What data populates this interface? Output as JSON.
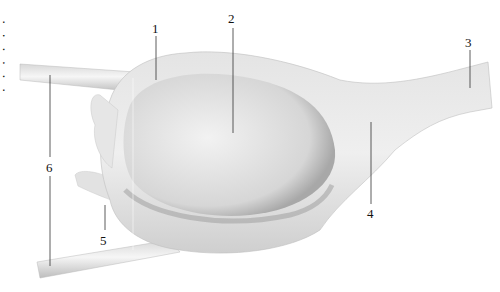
{
  "figure": {
    "edge_text": "· · · · · ·",
    "labels": [
      {
        "num": "1",
        "x": 152,
        "y": 22
      },
      {
        "num": "2",
        "x": 228,
        "y": 12
      },
      {
        "num": "3",
        "x": 465,
        "y": 36
      },
      {
        "num": "4",
        "x": 367,
        "y": 207
      },
      {
        "num": "5",
        "x": 100,
        "y": 234
      },
      {
        "num": "6",
        "x": 46,
        "y": 161
      }
    ]
  }
}
